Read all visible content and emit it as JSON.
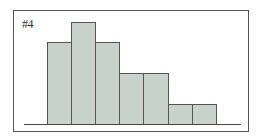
{
  "chart_data": {
    "type": "bar",
    "title": "#4",
    "subtype": "histogram",
    "categories": [
      "1",
      "2",
      "3",
      "4",
      "5",
      "6",
      "7"
    ],
    "values": [
      8,
      10,
      8,
      5,
      5,
      2,
      2
    ],
    "xlabel": "",
    "ylabel": "",
    "ylim": [
      0,
      10
    ],
    "grid": false,
    "legend": null,
    "colors": {
      "fill": "#c9d3cd",
      "edge": "#555555"
    }
  },
  "layout": {
    "baseline_y": 124,
    "bar_left": 47,
    "bar_width": 24.1,
    "px_per_unit": 10.2
  }
}
